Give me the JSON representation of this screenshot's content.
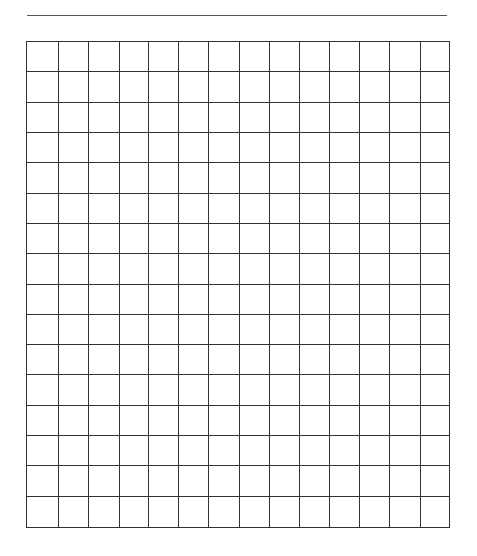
{
  "page": {
    "type": "blank grid worksheet",
    "title_line": "",
    "colors": {
      "line": "#333333",
      "title_line": "#555555",
      "background": "#ffffff"
    }
  },
  "grid": {
    "rows": 16,
    "columns": 14,
    "column_widths": [
      32,
      30,
      31,
      30,
      30,
      30,
      31,
      30,
      30,
      30,
      31,
      30,
      31,
      28
    ],
    "cells": []
  }
}
